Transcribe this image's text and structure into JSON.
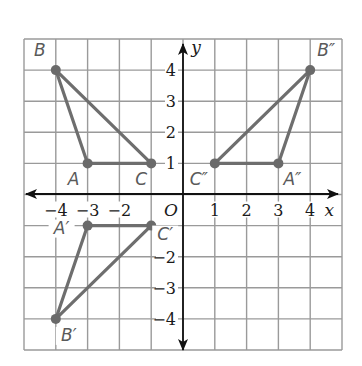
{
  "diagram": {
    "title": "",
    "x_axis": {
      "name": "x",
      "min": -5,
      "max": 5,
      "tick_labels": [
        "−4",
        "−3",
        "−2",
        "1",
        "2",
        "3",
        "4"
      ],
      "tick_values": [
        -4,
        -3,
        -2,
        1,
        2,
        3,
        4
      ]
    },
    "y_axis": {
      "name": "y",
      "min": -5,
      "max": 5,
      "tick_labels": [
        "4",
        "3",
        "2",
        "1",
        "−2",
        "−3",
        "−4"
      ],
      "tick_values": [
        4,
        3,
        2,
        1,
        -2,
        -3,
        -4
      ]
    },
    "origin_label": "O",
    "colors": {
      "grid": "#9a9a9a",
      "axis": "#111111",
      "triangle": "#6e6e6e",
      "point_label": "#5a5a5a"
    },
    "triangles": [
      {
        "name": "ABC",
        "vertices": [
          {
            "label": "A",
            "x": -3,
            "y": 1
          },
          {
            "label": "B",
            "x": -4,
            "y": 4
          },
          {
            "label": "C",
            "x": -1,
            "y": 1
          }
        ]
      },
      {
        "name": "A'B'C'",
        "vertices": [
          {
            "label": "A′",
            "x": -3,
            "y": -1
          },
          {
            "label": "B′",
            "x": -4,
            "y": -4
          },
          {
            "label": "C′",
            "x": -1,
            "y": -1
          }
        ]
      },
      {
        "name": "A''B''C''",
        "vertices": [
          {
            "label": "A″",
            "x": 3,
            "y": 1
          },
          {
            "label": "B″",
            "x": 4,
            "y": 4
          },
          {
            "label": "C″",
            "x": 1,
            "y": 1
          }
        ]
      }
    ]
  }
}
